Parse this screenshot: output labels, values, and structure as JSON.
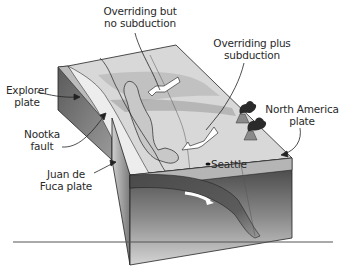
{
  "diagram": {
    "labels": {
      "overriding_no_subduction": {
        "line1": "Overriding but",
        "line2": "no subduction"
      },
      "overriding_plus_subduction": {
        "line1": "Overriding plus",
        "line2": "subduction"
      },
      "explorer_plate": {
        "line1": "Explorer",
        "line2": "plate"
      },
      "nootka_fault": {
        "line1": "Nootka",
        "line2": "fault"
      },
      "juan_de_fuca_plate": {
        "line1": "Juan de",
        "line2": "Fuca plate"
      },
      "north_america_plate": {
        "line1": "North America",
        "line2": "plate"
      },
      "seattle": "Seattle"
    },
    "colors": {
      "surface_light": "#d9d9d9",
      "surface_mid": "#bdbdbd",
      "side_front": "#8c8c8c",
      "side_dark": "#4a4a4a",
      "slab": "#5a5a5a",
      "outline": "#222222"
    }
  }
}
